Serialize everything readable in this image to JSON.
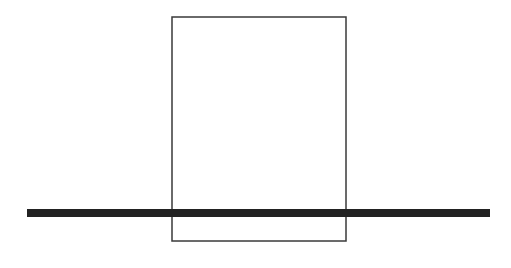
{
  "canvas": {
    "width": 511,
    "height": 268,
    "background": "#ffffff"
  },
  "shapes": {
    "rectangle": {
      "x": 172,
      "y": 17,
      "width": 174,
      "height": 224,
      "stroke": "#3a3a3a",
      "stroke_width": 1.5,
      "fill": "none"
    },
    "bar": {
      "x1": 27,
      "x2": 490,
      "y": 213,
      "thickness": 8,
      "color": "#222222"
    }
  }
}
